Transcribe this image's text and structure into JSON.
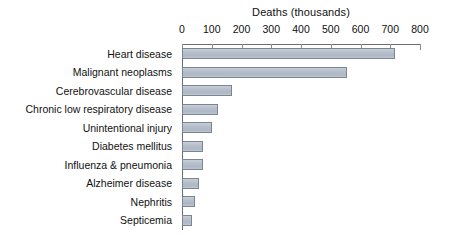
{
  "chart_data": {
    "type": "bar",
    "orientation": "horizontal",
    "title": "Deaths (thousands)",
    "xlabel": "Deaths (thousands)",
    "ylabel": "",
    "xlim": [
      0,
      800
    ],
    "xticks": [
      0,
      100,
      200,
      300,
      400,
      500,
      600,
      700,
      800
    ],
    "xtick_labels": [
      "0",
      "100",
      "200",
      "300",
      "400",
      "500",
      "600",
      "700",
      "800"
    ],
    "grid": false,
    "legend": "none",
    "axis_position": "top",
    "categories": [
      "Heart disease",
      "Malignant neoplasms",
      "Cerebrovascular disease",
      "Chronic low respiratory disease",
      "Unintentional injury",
      "Diabetes mellitus",
      "Influenza & pneumonia",
      "Alzheimer disease",
      "Nephritis",
      "Septicemia"
    ],
    "values": [
      716,
      555,
      168,
      121,
      101,
      71,
      69,
      56,
      44,
      34
    ],
    "bar_fill_color": "#b4bcc8",
    "bar_border_color": "#7c8592",
    "axis_color": "#6f6f6f"
  }
}
